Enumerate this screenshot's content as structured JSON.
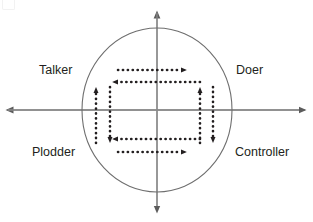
{
  "figure": {
    "type": "quadrant-diagram",
    "title": "",
    "background_color": "#ffffff",
    "axis_color": "#808080",
    "circle_color": "#6e6e6e",
    "arrow_color": "#231f20",
    "text_color": "#231f20"
  },
  "labels": {
    "top_left": "Talker",
    "top_right": "Doer",
    "bottom_left": "Plodder",
    "bottom_right": "Controller"
  },
  "axes": {
    "horizontal": {
      "name": "horizontal-axis",
      "y": 110,
      "x_start": 8,
      "x_end": 305,
      "arrowheads": [
        "left",
        "right"
      ]
    },
    "vertical": {
      "name": "vertical-axis",
      "x": 157,
      "y_start": 13,
      "y_end": 211,
      "arrowheads": [
        "up",
        "down"
      ]
    }
  },
  "circle": {
    "center_x": 157,
    "center_y": 110,
    "radius_x": 75,
    "radius_y": 82
  },
  "flow_arrows": [
    {
      "name": "arrow-top-outer-right",
      "orientation": "horizontal",
      "direction": "right",
      "y": 70,
      "from": 118,
      "to": 187
    },
    {
      "name": "arrow-top-inner-left",
      "orientation": "horizontal",
      "direction": "left",
      "y": 82,
      "from": 200,
      "to": 112
    },
    {
      "name": "arrow-bottom-inner-left",
      "orientation": "horizontal",
      "direction": "left",
      "y": 139,
      "from": 200,
      "to": 112
    },
    {
      "name": "arrow-bottom-outer-right",
      "orientation": "horizontal",
      "direction": "right",
      "y": 152,
      "from": 118,
      "to": 187
    },
    {
      "name": "arrow-left-outer-up",
      "orientation": "vertical",
      "direction": "up",
      "x": 96,
      "from": 143,
      "to": 87
    },
    {
      "name": "arrow-left-inner-down",
      "orientation": "vertical",
      "direction": "down",
      "x": 110,
      "from": 87,
      "to": 143
    },
    {
      "name": "arrow-right-inner-up",
      "orientation": "vertical",
      "direction": "up",
      "x": 200,
      "from": 143,
      "to": 87
    },
    {
      "name": "arrow-right-outer-down",
      "orientation": "vertical",
      "direction": "down",
      "x": 213,
      "from": 87,
      "to": 143
    }
  ]
}
